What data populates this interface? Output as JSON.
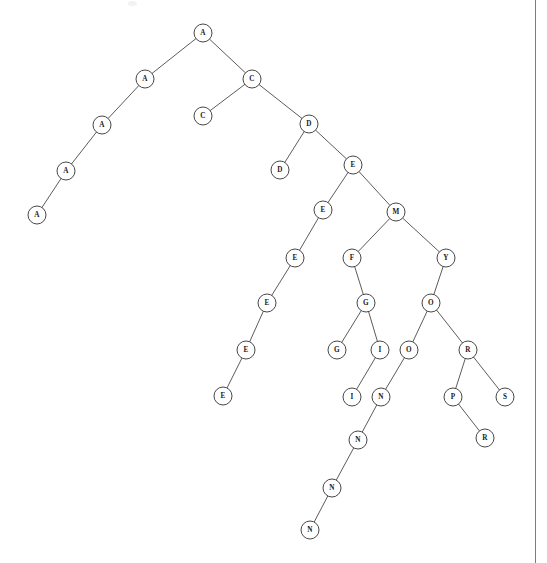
{
  "page": {
    "width": 547,
    "height": 563,
    "background_color": "#ffffff",
    "border_color": "#7d7d7d",
    "border_right_x": 535
  },
  "style": {
    "node_radius": 9,
    "node_fill": "#ffffff",
    "node_stroke": "#3d3d3d",
    "edge_stroke": "#4a4a4a",
    "label_color": "#1a1a1a"
  },
  "chart_data": {
    "type": "diagram",
    "diagram_type": "tree",
    "title": "",
    "node_count": 33,
    "edge_count": 32,
    "root_id": "n0",
    "nodes": [
      {
        "id": "n0",
        "label": "A",
        "x": 203,
        "y": 33,
        "depth": 0
      },
      {
        "id": "n1",
        "label": "A",
        "x": 145,
        "y": 79,
        "depth": 1
      },
      {
        "id": "n2",
        "label": "C",
        "x": 252,
        "y": 79,
        "depth": 1
      },
      {
        "id": "n3",
        "label": "A",
        "x": 102,
        "y": 125,
        "depth": 2
      },
      {
        "id": "n4",
        "label": "C",
        "x": 203,
        "y": 116,
        "depth": 2
      },
      {
        "id": "n5",
        "label": "D",
        "x": 309,
        "y": 124,
        "depth": 2
      },
      {
        "id": "n6",
        "label": "A",
        "x": 66,
        "y": 171,
        "depth": 3
      },
      {
        "id": "n7",
        "label": "D",
        "x": 280,
        "y": 170,
        "depth": 3
      },
      {
        "id": "n8",
        "label": "E",
        "x": 353,
        "y": 165,
        "depth": 3
      },
      {
        "id": "n9",
        "label": "A",
        "x": 37,
        "y": 215,
        "depth": 4
      },
      {
        "id": "n10",
        "label": "E",
        "x": 323,
        "y": 210,
        "depth": 4
      },
      {
        "id": "n11",
        "label": "M",
        "x": 396,
        "y": 212,
        "depth": 4
      },
      {
        "id": "n12",
        "label": "E",
        "x": 295,
        "y": 258,
        "depth": 5
      },
      {
        "id": "n13",
        "label": "F",
        "x": 352,
        "y": 258,
        "depth": 5
      },
      {
        "id": "n14",
        "label": "Y",
        "x": 446,
        "y": 258,
        "depth": 5
      },
      {
        "id": "n15",
        "label": "E",
        "x": 267,
        "y": 303,
        "depth": 6
      },
      {
        "id": "n16",
        "label": "G",
        "x": 366,
        "y": 303,
        "depth": 6
      },
      {
        "id": "n17",
        "label": "O",
        "x": 431,
        "y": 303,
        "depth": 6
      },
      {
        "id": "n18",
        "label": "E",
        "x": 246,
        "y": 350,
        "depth": 7
      },
      {
        "id": "n19",
        "label": "G",
        "x": 337,
        "y": 350,
        "depth": 7
      },
      {
        "id": "n20",
        "label": "I",
        "x": 380,
        "y": 350,
        "depth": 7
      },
      {
        "id": "n21",
        "label": "O",
        "x": 409,
        "y": 350,
        "depth": 7
      },
      {
        "id": "n22",
        "label": "R",
        "x": 468,
        "y": 350,
        "depth": 7
      },
      {
        "id": "n23",
        "label": "E",
        "x": 223,
        "y": 396,
        "depth": 8
      },
      {
        "id": "n24",
        "label": "I",
        "x": 352,
        "y": 397,
        "depth": 8
      },
      {
        "id": "n25",
        "label": "N",
        "x": 381,
        "y": 397,
        "depth": 8
      },
      {
        "id": "n26",
        "label": "P",
        "x": 453,
        "y": 397,
        "depth": 8
      },
      {
        "id": "n27",
        "label": "S",
        "x": 505,
        "y": 397,
        "depth": 8
      },
      {
        "id": "n28",
        "label": "N",
        "x": 358,
        "y": 440,
        "depth": 9
      },
      {
        "id": "n29",
        "label": "R",
        "x": 485,
        "y": 438,
        "depth": 9
      },
      {
        "id": "n30",
        "label": "N",
        "x": 332,
        "y": 488,
        "depth": 10
      },
      {
        "id": "n31",
        "label": "N",
        "x": 310,
        "y": 530,
        "depth": 11
      }
    ],
    "edges": [
      {
        "from": "n0",
        "to": "n1"
      },
      {
        "from": "n0",
        "to": "n2"
      },
      {
        "from": "n1",
        "to": "n3"
      },
      {
        "from": "n3",
        "to": "n6"
      },
      {
        "from": "n6",
        "to": "n9"
      },
      {
        "from": "n2",
        "to": "n4"
      },
      {
        "from": "n2",
        "to": "n5"
      },
      {
        "from": "n5",
        "to": "n7"
      },
      {
        "from": "n5",
        "to": "n8"
      },
      {
        "from": "n8",
        "to": "n10"
      },
      {
        "from": "n8",
        "to": "n11"
      },
      {
        "from": "n10",
        "to": "n12"
      },
      {
        "from": "n12",
        "to": "n15"
      },
      {
        "from": "n15",
        "to": "n18"
      },
      {
        "from": "n18",
        "to": "n23"
      },
      {
        "from": "n11",
        "to": "n13"
      },
      {
        "from": "n11",
        "to": "n14"
      },
      {
        "from": "n13",
        "to": "n16"
      },
      {
        "from": "n16",
        "to": "n19"
      },
      {
        "from": "n16",
        "to": "n20"
      },
      {
        "from": "n20",
        "to": "n24"
      },
      {
        "from": "n14",
        "to": "n17"
      },
      {
        "from": "n17",
        "to": "n21"
      },
      {
        "from": "n17",
        "to": "n22"
      },
      {
        "from": "n21",
        "to": "n25"
      },
      {
        "from": "n25",
        "to": "n28"
      },
      {
        "from": "n28",
        "to": "n30"
      },
      {
        "from": "n30",
        "to": "n31"
      },
      {
        "from": "n22",
        "to": "n26"
      },
      {
        "from": "n22",
        "to": "n27"
      },
      {
        "from": "n26",
        "to": "n29"
      }
    ]
  }
}
